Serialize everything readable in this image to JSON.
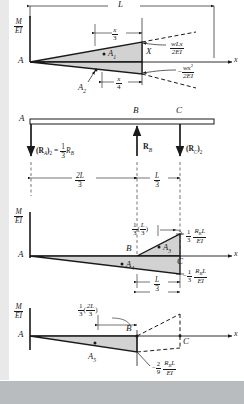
{
  "figure": {
    "axis_label_MEI_num": "M",
    "axis_label_MEI_den": "EI",
    "x_axis_label": "x",
    "colors": {
      "line": "#1a1a1a",
      "shade": "#d2d2d2",
      "dashed": "#1a1a1a",
      "page": "#ffffff",
      "margin": "#e9e9e9",
      "band": "#b9bcbf"
    }
  },
  "panel1": {
    "name": "M/EI diagram for distributed load w",
    "dim_L": "L",
    "dim_x_over_3_num": "x",
    "dim_x_over_3_den": "3",
    "dim_x_over_4_num": "x",
    "dim_x_over_4_den": "4",
    "point_A": "A",
    "point_X": "X",
    "area_A1": "A",
    "area_A1_sub": "1",
    "area_A2": "A",
    "area_A2_sub": "2",
    "curve_upper_num": "wLx",
    "curve_upper_den": "2EI",
    "curve_lower_sign": "−",
    "curve_lower_num": "wx",
    "curve_lower_num_sup": "2",
    "curve_lower_den": "2EI",
    "axis_num": "M",
    "axis_den": "EI",
    "x_label": "x"
  },
  "panel2": {
    "name": "Free body with redundant reaction R_B",
    "point_A": "A",
    "point_B": "B",
    "point_C": "C",
    "reaction_A": "(R",
    "reaction_A_sub1": "A",
    "reaction_A_close": ")",
    "reaction_A_sub2": "2",
    "reaction_A_eq": "=",
    "reaction_A_frac_num": "1",
    "reaction_A_frac_den": "3",
    "reaction_A_RB": "R",
    "reaction_A_RB_sub": "B",
    "reaction_B": "R",
    "reaction_B_sub": "B",
    "reaction_C": "(R",
    "reaction_C_sub1": "C",
    "reaction_C_close": ")",
    "reaction_C_sub2": "2",
    "dim_2L_num": "2L",
    "dim_2L_den": "3",
    "dim_L3_num": "L",
    "dim_L3_den": "3"
  },
  "panel3": {
    "name": "M/EI diagram including R_B effect",
    "axis_num": "M",
    "axis_den": "EI",
    "point_A": "A",
    "point_B": "B",
    "point_C": "C",
    "x_label": "x",
    "centroid_num": "1",
    "centroid_den": "3",
    "centroid_paren_open": "(",
    "centroid_inner_num": "L",
    "centroid_inner_den": "3",
    "centroid_paren_close": ")",
    "area_A3": "A",
    "area_A3_sub": "3",
    "area_A4": "A",
    "area_A4_sub": "4",
    "value_pos_frac_num": "1",
    "value_pos_frac_den": "3",
    "value_pos_num": "R",
    "value_pos_num_sub": "B",
    "value_pos_num_L": "L",
    "value_pos_den": "EI",
    "value_neg_sign": "−",
    "value_neg_frac_num": "1",
    "value_neg_frac_den": "3",
    "value_neg_num": "R",
    "value_neg_num_sub": "B",
    "value_neg_num_L": "L",
    "value_neg_den": "EI",
    "dim_L3_num": "L",
    "dim_L3_den": "3"
  },
  "panel4": {
    "name": "M/EI diagram segment AB with centroid A_5",
    "axis_num": "M",
    "axis_den": "EI",
    "point_A": "A",
    "point_B": "B",
    "point_C": "C",
    "x_label": "x",
    "centroid_num": "1",
    "centroid_den": "3",
    "centroid_paren_open": "(",
    "centroid_inner_num": "2L",
    "centroid_inner_den": "3",
    "centroid_paren_close": ")",
    "area_A5": "A",
    "area_A5_sub": "5",
    "value_sign": "−",
    "value_frac_num": "2",
    "value_frac_den": "9",
    "value_num": "R",
    "value_num_sub": "B",
    "value_num_L": "L",
    "value_den": "EI"
  }
}
